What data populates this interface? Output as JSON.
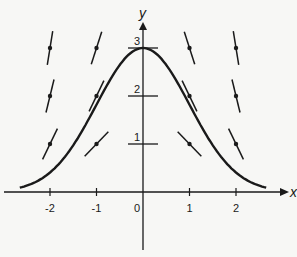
{
  "diagram": {
    "type": "slope-field",
    "axes": {
      "x_label": "x",
      "y_label": "y",
      "x_ticks": [
        -2,
        -1,
        0,
        1,
        2
      ],
      "x_tick_labels": [
        "-2",
        "-1",
        "0",
        "1",
        "2"
      ],
      "y_ticks": [
        1,
        2,
        3
      ],
      "y_tick_labels": [
        "1",
        "2",
        "3"
      ],
      "x_range": [
        -3,
        3
      ],
      "y_range": [
        -1.5,
        3.5
      ]
    },
    "slope_field": {
      "equation": "dy/dx = -x*y",
      "x_points": [
        -2,
        -1,
        1,
        2
      ],
      "y_points": [
        1,
        2,
        3
      ]
    },
    "curve": {
      "equation": "y = 3*exp(-x^2/2)",
      "x_range": [
        -2.65,
        2.65
      ]
    },
    "colors": {
      "ink": "#1a1a1a",
      "background": "#f7f7f5"
    }
  }
}
